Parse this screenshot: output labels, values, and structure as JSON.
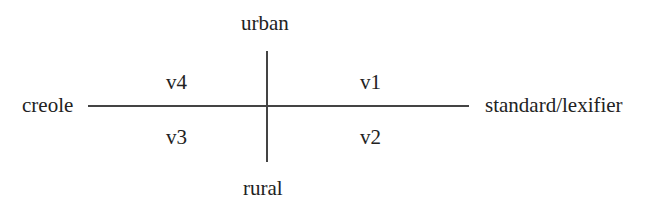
{
  "diagram": {
    "axes": {
      "vertical": {
        "top_label": "urban",
        "bottom_label": "rural"
      },
      "horizontal": {
        "left_label": "creole",
        "right_label": "standard/lexifier"
      }
    },
    "quadrants": {
      "top_left": "v4",
      "top_right": "v1",
      "bottom_left": "v3",
      "bottom_right": "v2"
    }
  }
}
